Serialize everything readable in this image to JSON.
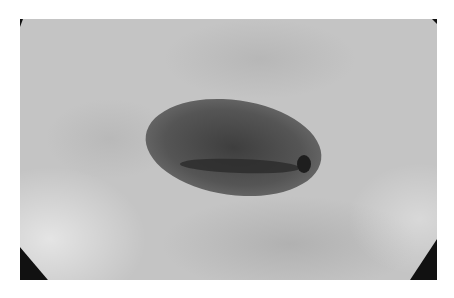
{
  "image": {
    "description": "Grayscale micrograph of a single oval, dark-stained cell with a central dark slit and a small dark spot at the right pole, on a mottled gray background with dark vignetted corners",
    "colors": {
      "background": "#c4c4c4",
      "cell": "#4a4a4a",
      "corners": "#111111",
      "frame": "#ffffff"
    }
  }
}
